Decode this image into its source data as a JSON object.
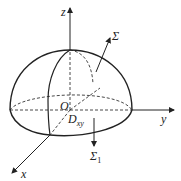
{
  "diagram": {
    "axes": {
      "z_label": "z",
      "y_label": "y",
      "x_label": "x"
    },
    "labels": {
      "origin": "O",
      "region_main": "D",
      "region_sub": "xy",
      "surface_top": "Σ",
      "surface_bottom_main": "Σ",
      "surface_bottom_sub": "1"
    },
    "colors": {
      "stroke": "#222222",
      "background": "#ffffff"
    }
  }
}
